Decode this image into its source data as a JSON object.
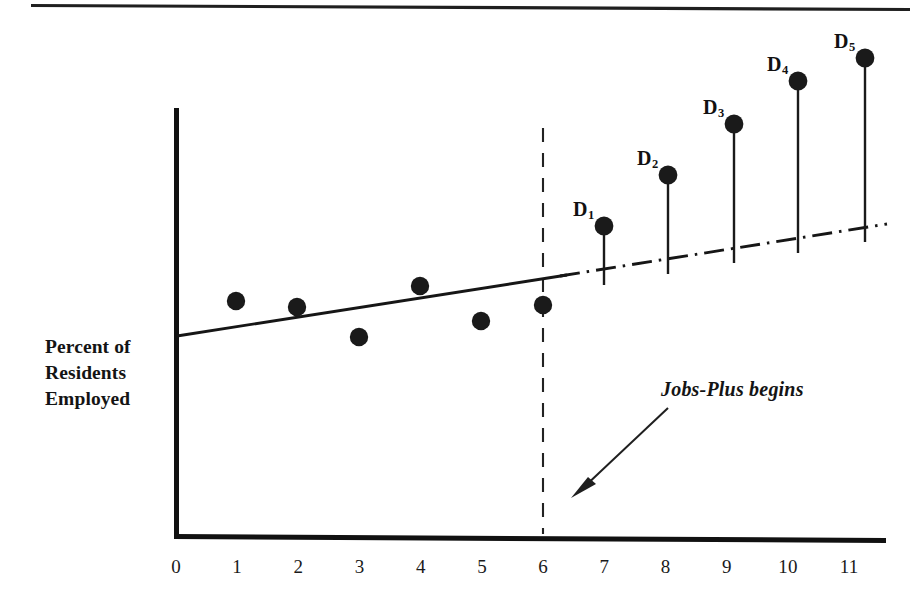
{
  "figure": {
    "top_rule": true,
    "ylabel": "Percent of\nResidents\nEmployed",
    "annotation": "Jobs-Plus begins",
    "marker_color": "#1a1a1a",
    "line_color": "#1a1a1a",
    "axis_color": "#111111"
  },
  "chart_data": {
    "type": "scatter",
    "title": "",
    "subtitle": "",
    "xlabel": "",
    "ylabel": "Percent of Residents Employed",
    "xlim": [
      0,
      11.6
    ],
    "ylim": [
      0,
      100
    ],
    "grid": false,
    "legend": null,
    "xticks": [
      "0",
      "1",
      "2",
      "3",
      "4",
      "5",
      "6",
      "7",
      "8",
      "9",
      "10",
      "11"
    ],
    "xtick_values": [
      0,
      1,
      2,
      3,
      4,
      5,
      6,
      7,
      8,
      9,
      10,
      11
    ],
    "yticks": [],
    "intervention": {
      "label": "Jobs-Plus begins",
      "x": 6.1,
      "line_style": "dashed"
    },
    "series": [
      {
        "name": "Pre-intervention observations",
        "style": "scatter",
        "x": [
          1.0,
          2.0,
          3.1,
          4.1,
          5.1,
          6.1
        ],
        "y": [
          55.0,
          53.0,
          45.5,
          58.5,
          49.0,
          52.0
        ]
      },
      {
        "name": "Pre-intervention trend line",
        "style": "solid-line",
        "x": [
          0.0,
          6.4
        ],
        "y": [
          47.0,
          57.5
        ]
      },
      {
        "name": "Projected trend (counterfactual)",
        "style": "dash-dot-line",
        "x": [
          6.4,
          11.5
        ],
        "y": [
          57.5,
          66.0
        ]
      },
      {
        "name": "Post-intervention observations",
        "style": "stem",
        "labels": [
          "D1",
          "D2",
          "D3",
          "D4",
          "D5"
        ],
        "x": [
          7.1,
          8.1,
          9.2,
          10.2,
          11.3
        ],
        "y": [
          73.5,
          85.5,
          97.5,
          107.5,
          113.0
        ],
        "baseline_y": [
          58.5,
          60.0,
          61.8,
          63.5,
          65.5
        ]
      }
    ],
    "point_labels": [
      {
        "text": "D",
        "sub": "1"
      },
      {
        "text": "D",
        "sub": "2"
      },
      {
        "text": "D",
        "sub": "3"
      },
      {
        "text": "D",
        "sub": "4"
      },
      {
        "text": "D",
        "sub": "5"
      }
    ]
  }
}
